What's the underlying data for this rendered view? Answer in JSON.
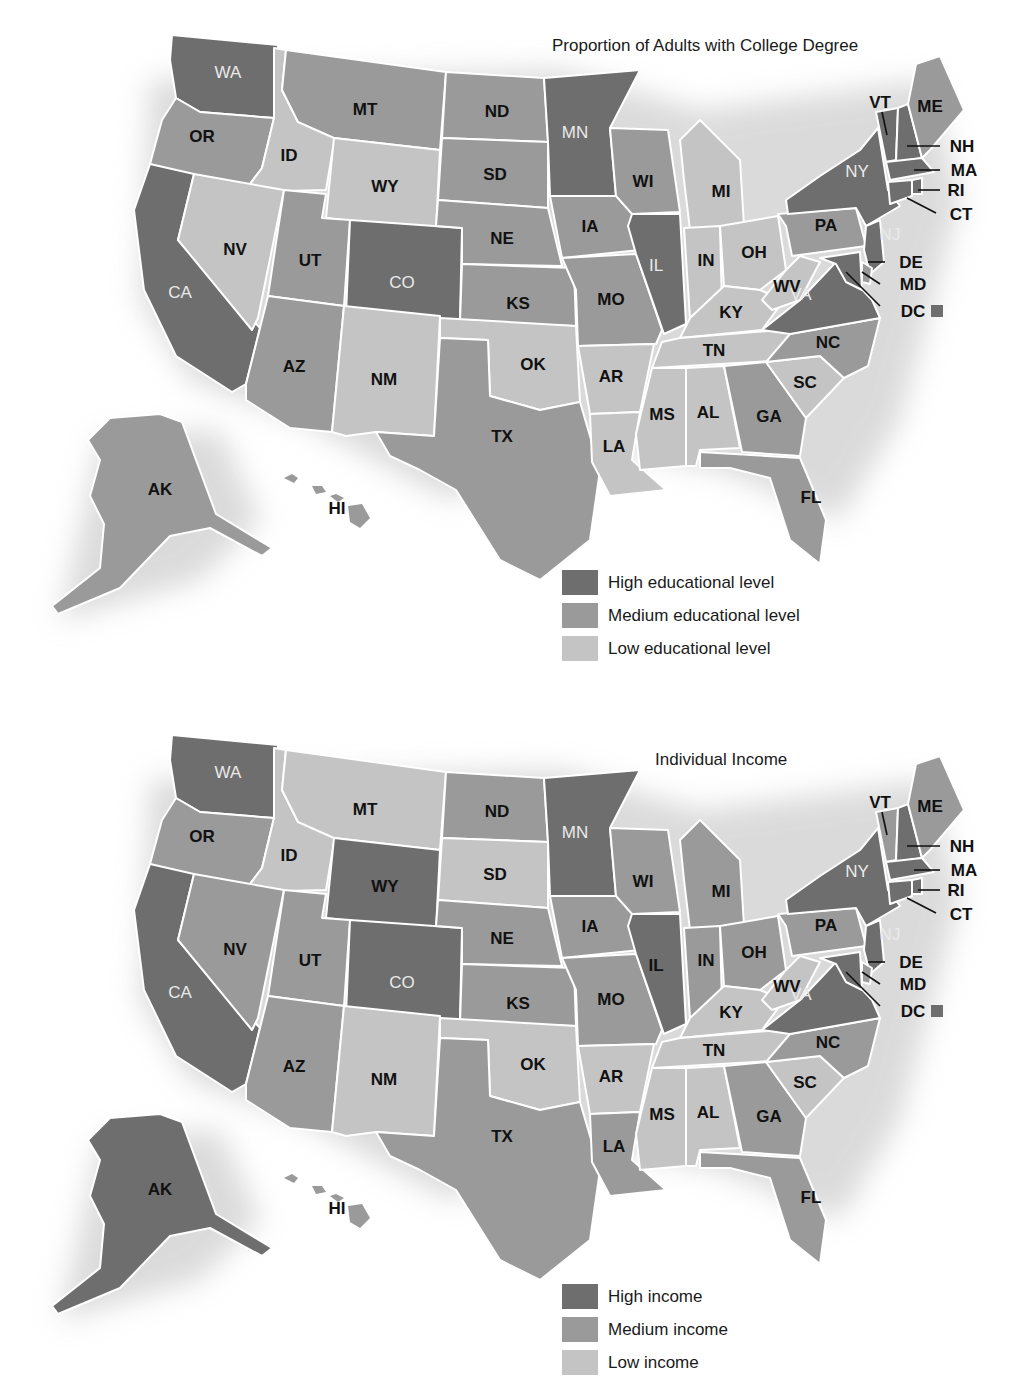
{
  "colors": {
    "high": "#6e6e6e",
    "medium": "#9a9a9a",
    "low": "#c4c4c4",
    "border": "#ffffff"
  },
  "maps": [
    {
      "title": "Proportion of Adults with College Degree",
      "legend": [
        {
          "level": "high",
          "label": "High educational level"
        },
        {
          "level": "medium",
          "label": "Medium educational level"
        },
        {
          "level": "low",
          "label": "Low educational level"
        }
      ],
      "states": {
        "WA": "high",
        "OR": "medium",
        "CA": "high",
        "ID": "low",
        "NV": "low",
        "MT": "medium",
        "WY": "low",
        "UT": "medium",
        "CO": "high",
        "AZ": "medium",
        "NM": "low",
        "ND": "medium",
        "SD": "medium",
        "NE": "medium",
        "KS": "medium",
        "OK": "low",
        "TX": "medium",
        "MN": "high",
        "IA": "medium",
        "MO": "medium",
        "AR": "low",
        "LA": "low",
        "WI": "medium",
        "IL": "high",
        "MI": "low",
        "IN": "low",
        "OH": "low",
        "KY": "low",
        "TN": "low",
        "MS": "low",
        "AL": "low",
        "GA": "medium",
        "FL": "medium",
        "SC": "low",
        "NC": "medium",
        "VA": "high",
        "WV": "low",
        "PA": "medium",
        "NY": "high",
        "VT": "high",
        "NH": "high",
        "ME": "medium",
        "MA": "high",
        "RI": "high",
        "CT": "high",
        "NJ": "high",
        "DE": "medium",
        "MD": "high",
        "DC": "high",
        "AK": "medium",
        "HI": "medium"
      }
    },
    {
      "title": "Individual Income",
      "legend": [
        {
          "level": "high",
          "label": "High income"
        },
        {
          "level": "medium",
          "label": "Medium income"
        },
        {
          "level": "low",
          "label": "Low income"
        }
      ],
      "states": {
        "WA": "high",
        "OR": "medium",
        "CA": "high",
        "ID": "low",
        "NV": "medium",
        "MT": "low",
        "WY": "high",
        "UT": "medium",
        "CO": "high",
        "AZ": "medium",
        "NM": "low",
        "ND": "medium",
        "SD": "low",
        "NE": "medium",
        "KS": "medium",
        "OK": "low",
        "TX": "medium",
        "MN": "high",
        "IA": "medium",
        "MO": "medium",
        "AR": "low",
        "LA": "medium",
        "WI": "medium",
        "IL": "high",
        "MI": "medium",
        "IN": "medium",
        "OH": "medium",
        "KY": "low",
        "TN": "low",
        "MS": "low",
        "AL": "low",
        "GA": "medium",
        "FL": "medium",
        "SC": "low",
        "NC": "medium",
        "VA": "high",
        "WV": "low",
        "PA": "medium",
        "NY": "high",
        "VT": "medium",
        "NH": "high",
        "ME": "medium",
        "MA": "high",
        "RI": "high",
        "CT": "high",
        "NJ": "high",
        "DE": "medium",
        "MD": "high",
        "DC": "high",
        "AK": "high",
        "HI": "medium"
      }
    }
  ],
  "state_labels": [
    "WA",
    "OR",
    "CA",
    "ID",
    "NV",
    "MT",
    "WY",
    "UT",
    "CO",
    "AZ",
    "NM",
    "ND",
    "SD",
    "NE",
    "KS",
    "OK",
    "TX",
    "MN",
    "IA",
    "MO",
    "AR",
    "LA",
    "WI",
    "IL",
    "MI",
    "IN",
    "OH",
    "KY",
    "TN",
    "MS",
    "AL",
    "GA",
    "FL",
    "SC",
    "NC",
    "VA",
    "WV",
    "PA",
    "NY",
    "VT",
    "NH",
    "ME",
    "MA",
    "RI",
    "CT",
    "NJ",
    "DE",
    "MD",
    "DC",
    "AK",
    "HI"
  ],
  "chart_data": [
    {
      "type": "choropleth",
      "title": "Proportion of Adults with College Degree",
      "categories": [
        "High educational level",
        "Medium educational level",
        "Low educational level"
      ],
      "high": [
        "WA",
        "CA",
        "CO",
        "MN",
        "IL",
        "VA",
        "NY",
        "VT",
        "NH",
        "MA",
        "RI",
        "CT",
        "NJ",
        "MD",
        "DC"
      ],
      "medium": [
        "OR",
        "MT",
        "UT",
        "AZ",
        "ND",
        "SD",
        "NE",
        "KS",
        "TX",
        "IA",
        "MO",
        "WI",
        "GA",
        "FL",
        "NC",
        "PA",
        "ME",
        "DE",
        "AK",
        "HI"
      ],
      "low": [
        "ID",
        "NV",
        "WY",
        "NM",
        "OK",
        "AR",
        "LA",
        "MI",
        "IN",
        "OH",
        "KY",
        "TN",
        "MS",
        "AL",
        "SC",
        "WV"
      ]
    },
    {
      "type": "choropleth",
      "title": "Individual Income",
      "categories": [
        "High income",
        "Medium income",
        "Low income"
      ],
      "high": [
        "WA",
        "CA",
        "WY",
        "CO",
        "MN",
        "IL",
        "VA",
        "NY",
        "NH",
        "MA",
        "RI",
        "CT",
        "NJ",
        "MD",
        "DC",
        "AK"
      ],
      "medium": [
        "OR",
        "NV",
        "UT",
        "AZ",
        "ND",
        "NE",
        "KS",
        "TX",
        "IA",
        "MO",
        "LA",
        "WI",
        "MI",
        "IN",
        "OH",
        "GA",
        "FL",
        "NC",
        "PA",
        "VT",
        "ME",
        "DE",
        "HI"
      ],
      "low": [
        "ID",
        "MT",
        "NM",
        "SD",
        "OK",
        "AR",
        "KY",
        "TN",
        "MS",
        "AL",
        "SC",
        "WV"
      ]
    }
  ]
}
